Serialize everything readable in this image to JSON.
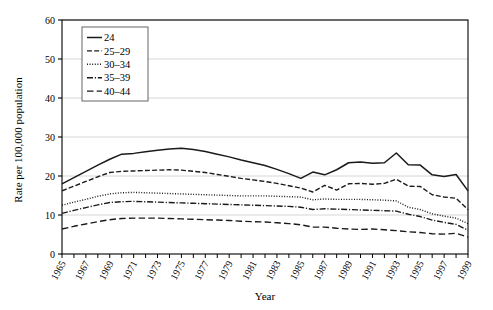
{
  "chart_data": {
    "type": "line",
    "title": "",
    "xlabel": "Year",
    "ylabel": "Rate per 100,000 population",
    "ylim": [
      0,
      60
    ],
    "ytick_values": [
      0,
      10,
      20,
      30,
      40,
      50,
      60
    ],
    "ytick_labels": [
      "0",
      "10",
      "20",
      "30",
      "40",
      "50",
      "60"
    ],
    "xlim": [
      1965,
      1999
    ],
    "x": [
      1965,
      1966,
      1967,
      1968,
      1969,
      1970,
      1971,
      1972,
      1973,
      1974,
      1975,
      1976,
      1977,
      1978,
      1979,
      1980,
      1981,
      1982,
      1983,
      1984,
      1985,
      1986,
      1987,
      1988,
      1989,
      1990,
      1991,
      1992,
      1993,
      1994,
      1995,
      1996,
      1997,
      1998,
      1999
    ],
    "xtick_labels": [
      "1965",
      "1967",
      "1969",
      "1971",
      "1973",
      "1975",
      "1977",
      "1979",
      "1981",
      "1983",
      "1985",
      "1987",
      "1989",
      "1991",
      "1993",
      "1995",
      "1997",
      "1999"
    ],
    "xtick_values": [
      1965,
      1967,
      1969,
      1971,
      1973,
      1975,
      1977,
      1979,
      1981,
      1983,
      1985,
      1987,
      1989,
      1991,
      1993,
      1995,
      1997,
      1999
    ],
    "grid": "horizontal",
    "legend_position": "top-left",
    "series": [
      {
        "name": "24",
        "style": "solid",
        "values": [
          18.0,
          19.6,
          21.2,
          22.8,
          24.3,
          25.6,
          25.8,
          26.2,
          26.6,
          26.9,
          27.1,
          26.8,
          26.3,
          25.6,
          24.9,
          24.1,
          23.4,
          22.7,
          21.7,
          20.6,
          19.4,
          21.0,
          20.3,
          21.6,
          23.4,
          23.6,
          23.3,
          23.4,
          25.9,
          22.9,
          22.8,
          20.3,
          19.9,
          20.4,
          16.2
        ]
      },
      {
        "name": "25–29",
        "style": "dashed",
        "values": [
          16.2,
          17.4,
          18.6,
          19.8,
          20.9,
          21.2,
          21.3,
          21.4,
          21.5,
          21.6,
          21.5,
          21.2,
          20.9,
          20.4,
          19.9,
          19.4,
          19.0,
          18.6,
          18.1,
          17.5,
          16.9,
          15.9,
          17.6,
          16.4,
          18.0,
          18.1,
          17.9,
          18.1,
          19.2,
          17.4,
          17.3,
          15.2,
          14.6,
          14.3,
          11.4
        ]
      },
      {
        "name": "30–34",
        "style": "dotted",
        "values": [
          12.5,
          13.3,
          14.0,
          14.8,
          15.4,
          15.7,
          15.8,
          15.7,
          15.6,
          15.5,
          15.4,
          15.3,
          15.2,
          15.1,
          15.0,
          14.9,
          14.9,
          14.9,
          14.8,
          14.7,
          14.6,
          13.9,
          14.1,
          14.0,
          14.0,
          14.0,
          13.9,
          13.8,
          13.6,
          12.0,
          11.4,
          10.3,
          9.7,
          9.2,
          7.8
        ]
      },
      {
        "name": "35–39",
        "style": "dashdot",
        "values": [
          10.4,
          11.2,
          11.9,
          12.6,
          13.2,
          13.4,
          13.5,
          13.4,
          13.3,
          13.2,
          13.1,
          13.0,
          12.9,
          12.8,
          12.7,
          12.6,
          12.5,
          12.4,
          12.3,
          12.2,
          12.0,
          11.4,
          11.6,
          11.5,
          11.4,
          11.3,
          11.2,
          11.1,
          11.0,
          10.2,
          9.6,
          8.7,
          8.1,
          7.6,
          6.1
        ]
      },
      {
        "name": "40–44",
        "style": "dashed-long",
        "values": [
          6.4,
          7.1,
          7.7,
          8.3,
          8.8,
          9.1,
          9.2,
          9.2,
          9.2,
          9.1,
          9.0,
          8.9,
          8.8,
          8.7,
          8.6,
          8.4,
          8.3,
          8.2,
          8.0,
          7.8,
          7.5,
          6.9,
          6.9,
          6.6,
          6.4,
          6.3,
          6.4,
          6.2,
          6.0,
          5.7,
          5.5,
          5.2,
          5.1,
          5.3,
          4.3
        ]
      }
    ]
  },
  "legend": {
    "items": [
      {
        "label": "24"
      },
      {
        "label": "25–29"
      },
      {
        "label": "30–34"
      },
      {
        "label": "35–39"
      },
      {
        "label": "40–44"
      }
    ]
  }
}
